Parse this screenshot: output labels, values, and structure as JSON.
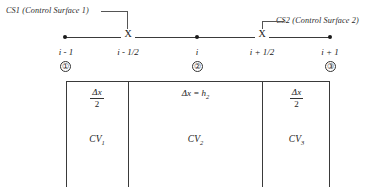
{
  "diagram": {
    "callouts": [
      {
        "id": "cs1",
        "label": "CS1 (Control Surface 1)"
      },
      {
        "id": "cs2",
        "label": "CS2 (Control Surface 2)"
      }
    ],
    "axis": {
      "node_marker": "●",
      "face_marker": "X",
      "nodes": [
        {
          "label": "i - 1",
          "circled": "①"
        },
        {
          "label": "i",
          "circled": "②"
        },
        {
          "label": "i + 1",
          "circled": "③"
        }
      ],
      "faces": [
        {
          "label": "i - 1/2"
        },
        {
          "label": "i + 1/2"
        }
      ]
    },
    "control_volumes": [
      {
        "name": "CV1",
        "cv_text": "CV",
        "cv_subscript": "1",
        "size_type": "fraction",
        "numerator": "Δx",
        "denominator": "2"
      },
      {
        "name": "CV2",
        "cv_text": "CV",
        "cv_subscript": "2",
        "size_type": "inline",
        "size_lhs": "Δx =",
        "size_rhs": "h",
        "size_rhs_subscript": "2"
      },
      {
        "name": "CV3",
        "cv_text": "CV",
        "cv_subscript": "3",
        "size_type": "fraction",
        "numerator": "Δx",
        "denominator": "2"
      }
    ],
    "colors": {
      "line": "#3a3a3a",
      "text": "#222222",
      "background": "#ffffff",
      "leader": "#555555"
    }
  }
}
